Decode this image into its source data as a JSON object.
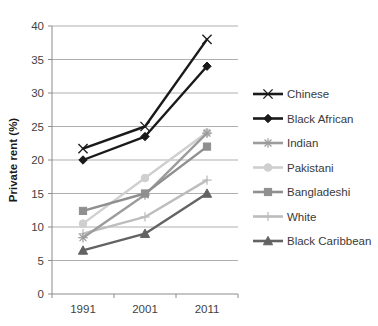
{
  "chart_data": {
    "type": "line",
    "title": "",
    "xlabel": "",
    "ylabel": "Private rent (%)",
    "categories": [
      "1991",
      "2001",
      "2011"
    ],
    "ylim": [
      0,
      40
    ],
    "yticks": [
      0,
      5,
      10,
      15,
      20,
      25,
      30,
      35,
      40
    ],
    "grid": true,
    "legend_position": "right",
    "series": [
      {
        "name": "Chinese",
        "values": [
          21.7,
          25.0,
          38.0
        ],
        "color": "#1a1a1a",
        "marker": "x-cross-marker"
      },
      {
        "name": "Black African",
        "values": [
          20.0,
          23.5,
          34.0
        ],
        "color": "#1a1a1a",
        "marker": "diamond-marker"
      },
      {
        "name": "Indian",
        "values": [
          8.4,
          14.8,
          24.0
        ],
        "color": "#9c9c9c",
        "marker": "asterisk-marker"
      },
      {
        "name": "Pakistani",
        "values": [
          10.5,
          17.3,
          24.1
        ],
        "color": "#cfcfcf",
        "marker": "circle-marker"
      },
      {
        "name": "Bangladeshi",
        "values": [
          12.4,
          15.0,
          22.0
        ],
        "color": "#8f8f8f",
        "marker": "square-marker"
      },
      {
        "name": "White",
        "values": [
          9.0,
          11.5,
          17.0
        ],
        "color": "#bdbdbd",
        "marker": "plus-marker"
      },
      {
        "name": "Black Caribbean",
        "values": [
          6.5,
          9.0,
          15.0
        ],
        "color": "#636363",
        "marker": "triangle-marker"
      }
    ]
  },
  "axis": {
    "y_title": "Private rent (%)",
    "y_tick_labels": [
      "40",
      "35",
      "30",
      "25",
      "20",
      "15",
      "10",
      "5",
      "0"
    ],
    "x_tick_labels": [
      "1991",
      "2001",
      "2011"
    ]
  },
  "legend": {
    "items": [
      {
        "label": "Chinese"
      },
      {
        "label": "Black African"
      },
      {
        "label": "Indian"
      },
      {
        "label": "Pakistani"
      },
      {
        "label": "Bangladeshi"
      },
      {
        "label": "White"
      },
      {
        "label": "Black Caribbean"
      }
    ]
  }
}
